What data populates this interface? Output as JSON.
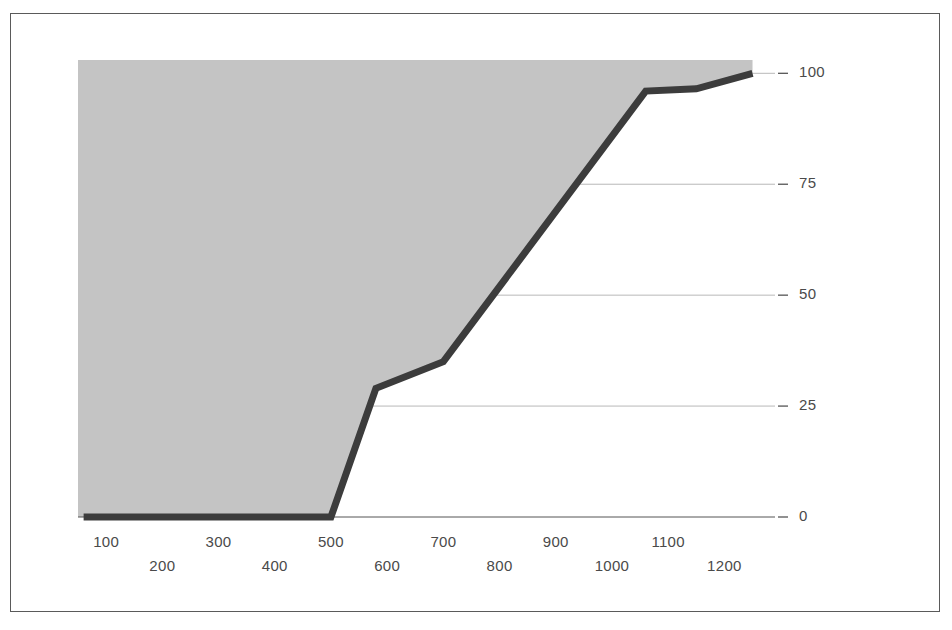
{
  "chart_data": {
    "type": "area",
    "title": "",
    "subtitle": "",
    "xlabel": "",
    "ylabel": "",
    "xlim": [
      50,
      1290
    ],
    "ylim": [
      0,
      103
    ],
    "grid": true,
    "grid_axis": "y",
    "legend": "none",
    "x_tick_labels": [
      "100",
      "200",
      "300",
      "400",
      "500",
      "600",
      "700",
      "800",
      "900",
      "1000",
      "1100",
      "1200"
    ],
    "x_tick_values": [
      100,
      200,
      300,
      400,
      500,
      600,
      700,
      800,
      900,
      1000,
      1100,
      1200
    ],
    "x_tick_rows": [
      0,
      1,
      0,
      1,
      0,
      1,
      0,
      1,
      0,
      1,
      0,
      1
    ],
    "y_tick_labels": [
      "0",
      "25",
      "50",
      "75",
      "100"
    ],
    "y_tick_values": [
      0,
      25,
      50,
      75,
      100
    ],
    "series": [
      {
        "name": "cumulative",
        "fill": true,
        "fill_side": "above-left",
        "x": [
          60,
          500,
          580,
          700,
          1060,
          1150,
          1250
        ],
        "values": [
          0,
          0,
          29,
          35,
          96,
          96.5,
          100
        ]
      }
    ],
    "annotations": []
  },
  "style": {
    "fill_color": "#c4c4c4",
    "line_color": "#3c3c3c",
    "grid_color": "#b8b8b8",
    "axis_color": "#555555",
    "frame_color": "#5a5a5a",
    "text_color": "#4a4a4a",
    "background": "#ffffff"
  },
  "geometry": {
    "plot_left": 78,
    "plot_right": 775,
    "plot_top": 60,
    "plot_bottom": 517,
    "line_width": 7
  }
}
